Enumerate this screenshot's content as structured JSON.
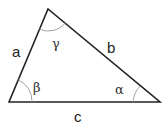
{
  "diagram": {
    "type": "triangle",
    "vertices": {
      "top": [
        48,
        9
      ],
      "bottom_left": [
        9,
        102
      ],
      "bottom_right": [
        160,
        102
      ]
    },
    "sides": [
      {
        "name": "a",
        "label": "a",
        "pos": [
          17,
          57
        ]
      },
      {
        "name": "b",
        "label": "b",
        "pos": [
          112,
          52
        ]
      },
      {
        "name": "c",
        "label": "c",
        "pos": [
          79,
          121
        ]
      }
    ],
    "angles": [
      {
        "name": "gamma",
        "label": "γ",
        "pos": [
          57,
          47
        ]
      },
      {
        "name": "beta",
        "label": "β",
        "pos": [
          37,
          92
        ]
      },
      {
        "name": "alpha",
        "label": "α",
        "pos": [
          119,
          93
        ]
      }
    ],
    "colors": {
      "stroke": "#222222",
      "arc": "#999999",
      "background": "#ffffff"
    }
  }
}
